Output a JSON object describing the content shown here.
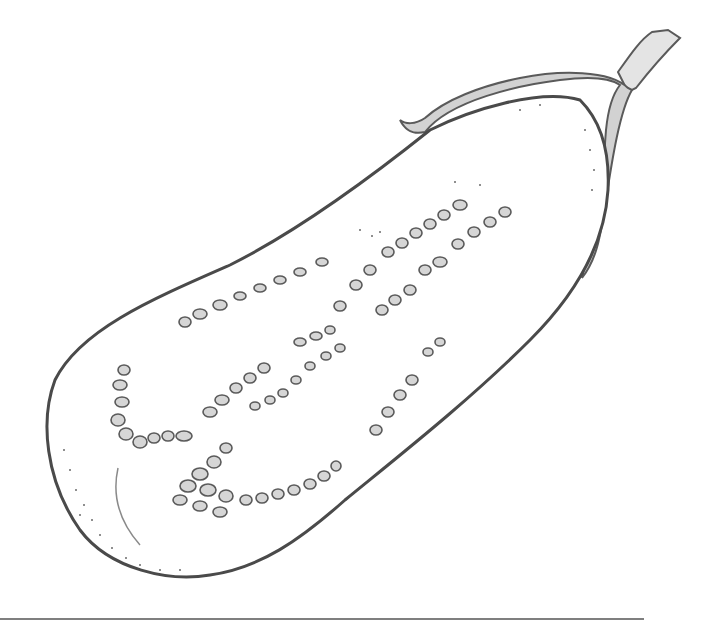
{
  "illustration": {
    "subject": "Halved eggplant, pen-and-ink drawing",
    "ink_color": "#5a5a5a",
    "fill_gray": "#c8c8c8",
    "background": "#ffffff"
  }
}
